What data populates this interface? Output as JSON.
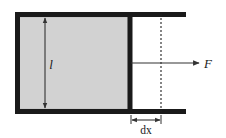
{
  "figure": {
    "kind": "physics-diagram",
    "width": 226,
    "height": 138,
    "background_color": "#ffffff"
  },
  "colors": {
    "frame_stroke": "#1a1a1a",
    "film_fill": "#d2d2d2",
    "film_stroke": "#9a9a9a",
    "annotation_stroke": "#333333",
    "dashed_stroke": "#222222",
    "label_color": "#1a1a1a"
  },
  "frame": {
    "name": "u-shaped-wire-frame",
    "top_rail": {
      "x1": 16,
      "y1": 14,
      "x2": 186,
      "y2": 14,
      "thickness": 5
    },
    "bottom_rail": {
      "x1": 16,
      "y1": 112,
      "x2": 186,
      "y2": 112,
      "thickness": 5
    },
    "left_rail": {
      "x1": 16,
      "y1": 14,
      "x2": 16,
      "y2": 112,
      "thickness": 5
    },
    "slider_bar": {
      "x1": 130,
      "y1": 14,
      "x2": 130,
      "y2": 112,
      "thickness": 5
    }
  },
  "film": {
    "name": "soap-film-region",
    "x": 19,
    "y": 17,
    "width": 109,
    "height": 92,
    "fill": "#d2d2d2"
  },
  "dimension_length": {
    "name": "film-length-dimension",
    "label": "l",
    "italic": true,
    "x": 45,
    "y_top": 17,
    "y_bottom": 109,
    "label_x": 50,
    "label_y": 68,
    "font_size": 13
  },
  "force_arrow": {
    "name": "applied-force-arrow",
    "label": "F",
    "italic": true,
    "x_start": 131,
    "x_end": 200,
    "y": 63,
    "label_x": 206,
    "label_y": 68,
    "font_size": 13
  },
  "displacement": {
    "name": "displacement-dimension",
    "label": "dx",
    "x_start": 131,
    "x_end": 161,
    "y": 120,
    "label_x": 146,
    "label_y": 134,
    "font_size": 11
  },
  "dashed_line": {
    "name": "displaced-position-guide",
    "x": 161,
    "y_top": 14,
    "y_bottom": 112,
    "dash_pattern": "2,2"
  }
}
